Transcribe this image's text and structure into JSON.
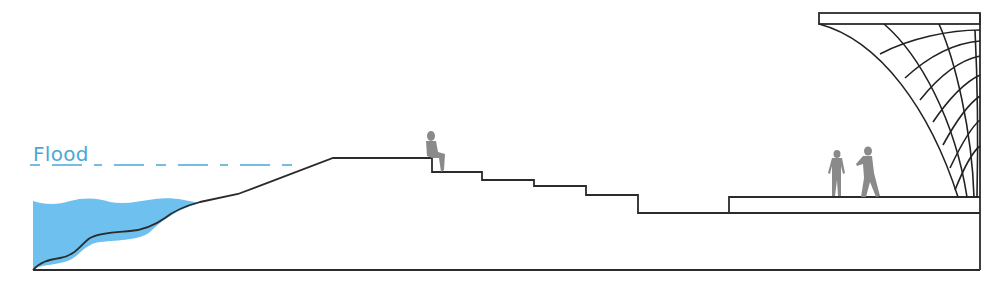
{
  "diagram": {
    "type": "section-drawing",
    "labels": {
      "flood": "Flood"
    },
    "colors": {
      "water": "#6ec1ee",
      "flood_line": "#4aa8d8",
      "outline": "#2b2b2b",
      "figure": "#8a8a8a"
    },
    "elements": [
      {
        "name": "water-body",
        "description": "Blue water at left edge against sloped bank"
      },
      {
        "name": "flood-level-line",
        "description": "Dashed blue line marking flood level"
      },
      {
        "name": "embankment-slope",
        "description": "Sloped bank rising to top platform"
      },
      {
        "name": "stepped-terrace",
        "description": "Series of descending steps"
      },
      {
        "name": "plaza-platform",
        "description": "Raised plaza with two standing people"
      },
      {
        "name": "gridshell-canopy",
        "description": "Curved lattice canopy structure at right"
      },
      {
        "name": "seated-person",
        "description": "Person sitting at top step"
      },
      {
        "name": "standing-people",
        "description": "Two people standing on plaza"
      }
    ]
  }
}
